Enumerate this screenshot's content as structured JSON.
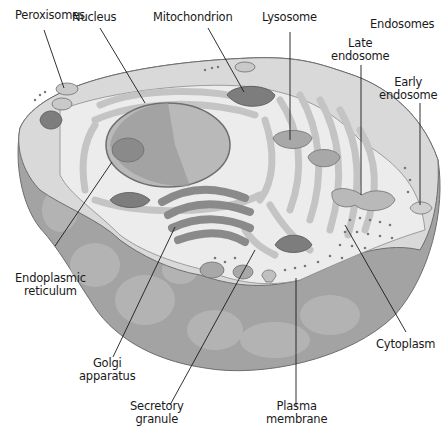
{
  "diagram": {
    "labels": {
      "peroxisomes": "Peroxisomes",
      "nucleus": "Nucleus",
      "mitochondrion": "Mitochondrion",
      "lysosome": "Lysosome",
      "endosomes": "Endosomes",
      "late_endosome_1": "Late",
      "late_endosome_2": "endosome",
      "early_endosome_1": "Early",
      "early_endosome_2": "endosome",
      "er_1": "Endoplasmic",
      "er_2": "reticulum",
      "golgi_1": "Golgi",
      "golgi_2": "apparatus",
      "secretory_1": "Secretory",
      "secretory_2": "granule",
      "plasma_1": "Plasma",
      "plasma_2": "membrane",
      "cytoplasm": "Cytoplasm"
    },
    "colors": {
      "background": "#ffffff",
      "cell_top": "#d9d9d9",
      "cell_side": "#a3a3a3",
      "cell_side_blob": "#b8b8b8",
      "cut_face": "#ececec",
      "er": "#c4c4c4",
      "nucleus_light": "#b9b9b9",
      "nucleus_dark": "#9a9a9a",
      "mitochondria": "#7d7d7d",
      "golgi": "#8a8a8a",
      "outline": "#6e6e6e",
      "leader_line": "#1a1a1a",
      "text": "#1a1a1a"
    }
  }
}
